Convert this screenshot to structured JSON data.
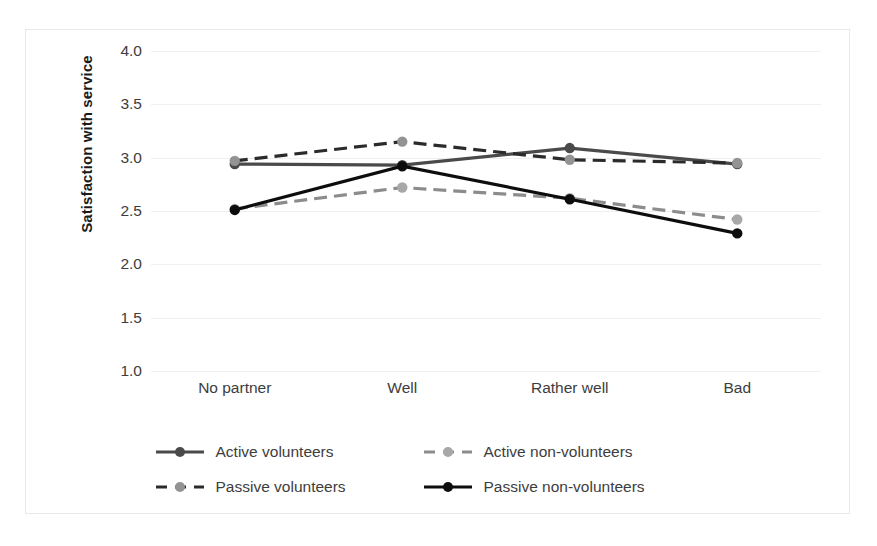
{
  "chart_data": {
    "type": "line",
    "title": "",
    "xlabel": "",
    "ylabel": "Satisfaction with service",
    "categories": [
      "No partner",
      "Well",
      "Rather well",
      "Bad"
    ],
    "ylim": [
      1.0,
      4.0
    ],
    "yticks": [
      "1.0",
      "1.5",
      "2.0",
      "2.5",
      "3.0",
      "3.5",
      "4.0"
    ],
    "ytick_values": [
      1.0,
      1.5,
      2.0,
      2.5,
      3.0,
      3.5,
      4.0
    ],
    "grid": true,
    "legend_position": "bottom",
    "series": [
      {
        "name": "Active volunteers",
        "values": [
          2.94,
          2.93,
          3.09,
          2.94
        ],
        "color": "#4a4a4a",
        "marker_color": "#4a4a4a",
        "style": "solid"
      },
      {
        "name": "Active non-volunteers",
        "values": [
          2.52,
          2.72,
          2.62,
          2.42
        ],
        "color": "#8c8c8c",
        "marker_color": "#a8a8a8",
        "style": "dashed"
      },
      {
        "name": "Passive volunteers",
        "values": [
          2.97,
          3.15,
          2.98,
          2.95
        ],
        "color": "#2b2b2b",
        "marker_color": "#939393",
        "style": "dashed"
      },
      {
        "name": "Passive non-volunteers",
        "values": [
          2.51,
          2.92,
          2.61,
          2.29
        ],
        "color": "#0d0d0d",
        "marker_color": "#0d0d0d",
        "style": "solid"
      }
    ]
  },
  "legend": {
    "rows": [
      [
        "Active volunteers",
        "Active non-volunteers"
      ],
      [
        "Passive volunteers",
        "Passive non-volunteers"
      ]
    ]
  }
}
